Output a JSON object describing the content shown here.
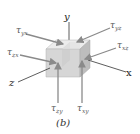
{
  "figure": {
    "caption": "(b)",
    "axes": {
      "x": "x",
      "y": "y",
      "z": "z"
    },
    "stresses": [
      {
        "id": "tau_yx",
        "symbol": "τ",
        "subscript": "yx"
      },
      {
        "id": "tau_yz",
        "symbol": "τ",
        "subscript": "yz"
      },
      {
        "id": "tau_zx",
        "symbol": "τ",
        "subscript": "zx"
      },
      {
        "id": "tau_xz",
        "symbol": "τ",
        "subscript": "xz"
      },
      {
        "id": "tau_zy",
        "symbol": "τ",
        "subscript": "zy"
      },
      {
        "id": "tau_xy",
        "symbol": "τ",
        "subscript": "xy"
      }
    ],
    "colors": {
      "cube_front": "#d6d6d6",
      "cube_top": "#ececec",
      "cube_side": "#bdbdbd",
      "arrow": "#8a8a8a",
      "axis": "#333333"
    }
  }
}
